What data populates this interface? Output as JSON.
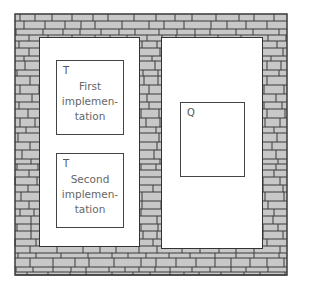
{
  "diagram": {
    "colors": {
      "brick": "#c8c8c8",
      "mortar": "#3a3a3a",
      "panel": "#ffffff"
    },
    "left_panel": {
      "boxes": [
        {
          "tag": "T",
          "label": "First\nimplemen-\ntation"
        },
        {
          "tag": "T",
          "label": "Second\nimplemen-\ntation"
        }
      ]
    },
    "right_panel": {
      "boxes": [
        {
          "tag": "Q",
          "label": ""
        }
      ]
    }
  }
}
